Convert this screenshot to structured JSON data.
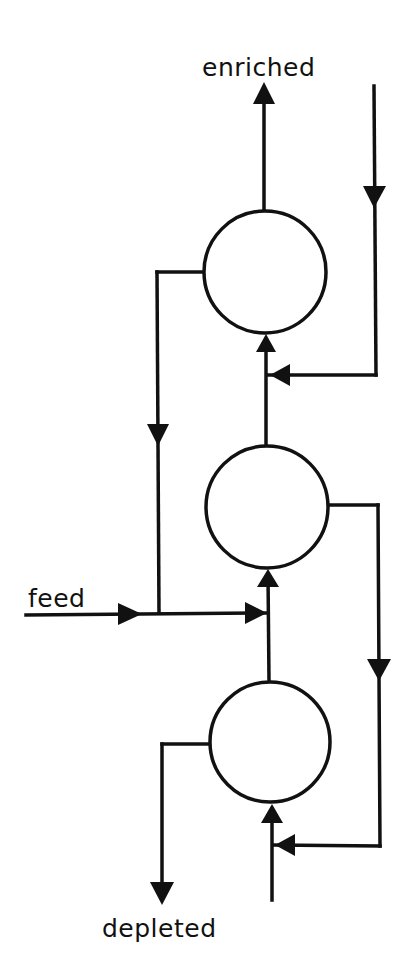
{
  "diagram": {
    "type": "cascade-flow",
    "labels": {
      "enriched": "enriched",
      "feed": "feed",
      "depleted": "depleted"
    },
    "stages": [
      {
        "id": "stage-top",
        "cx": 265,
        "cy": 272,
        "r": 61
      },
      {
        "id": "stage-middle",
        "cx": 267,
        "cy": 507,
        "r": 61
      },
      {
        "id": "stage-bottom",
        "cx": 270,
        "cy": 742,
        "r": 60
      }
    ],
    "flows": [
      {
        "from": "stage-top",
        "to": "enriched-output",
        "direction": "up"
      },
      {
        "from": "external-input",
        "to": "stage-top",
        "via": "right-side-return"
      },
      {
        "from": "stage-top",
        "to": "feed-junction",
        "via": "left-side-down"
      },
      {
        "from": "feed",
        "to": "stage-middle"
      },
      {
        "from": "stage-middle",
        "to": "stage-top",
        "direction": "up"
      },
      {
        "from": "stage-middle",
        "to": "stage-bottom-return",
        "via": "right-side-down"
      },
      {
        "from": "stage-bottom",
        "to": "stage-middle",
        "direction": "up"
      },
      {
        "from": "stage-bottom",
        "to": "depleted-output",
        "via": "left-side-down"
      },
      {
        "from": "bottom-input",
        "to": "stage-bottom",
        "direction": "up"
      }
    ],
    "colors": {
      "ink": "#111111",
      "background": "#ffffff"
    }
  }
}
